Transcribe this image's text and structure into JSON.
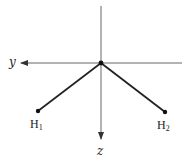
{
  "diagram": {
    "type": "molecular-geometry",
    "colors": {
      "background": "#ffffff",
      "axis": "#444444",
      "bond": "#222222",
      "text": "#222222"
    },
    "axes": {
      "y": {
        "label": "y",
        "direction": "left"
      },
      "z": {
        "label": "z",
        "direction": "down"
      }
    },
    "center": {
      "x": 101,
      "y": 63
    },
    "atoms": [
      {
        "id": "H1",
        "symbol": "H",
        "subscript": "1",
        "x": 38,
        "y": 111
      },
      {
        "id": "H2",
        "symbol": "H",
        "subscript": "2",
        "x": 165,
        "y": 112
      }
    ]
  }
}
